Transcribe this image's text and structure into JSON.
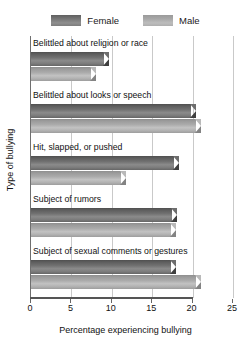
{
  "chart_data": {
    "type": "bar",
    "orientation": "horizontal",
    "title": "",
    "xlabel": "Percentage experiencing bullying",
    "ylabel": "Type of bullying",
    "xlim": [
      0,
      25
    ],
    "xticks": [
      0,
      5,
      10,
      15,
      20,
      25
    ],
    "xtick_labels": [
      "0",
      "5",
      "10",
      "15",
      "20",
      "25"
    ],
    "grid": "vertical",
    "legend_position": "top-center",
    "categories": [
      "Belittled about religion or race",
      "Belittled about looks or speech",
      "Hit, slapped, or pushed",
      "Subject of rumors",
      "Subject of sexual comments or gestures"
    ],
    "series": [
      {
        "name": "Female",
        "color": "#717171",
        "values": [
          9.0,
          19.8,
          17.7,
          17.4,
          17.3
        ]
      },
      {
        "name": "Male",
        "color": "#ababab",
        "values": [
          7.4,
          20.4,
          11.1,
          17.3,
          20.4
        ]
      }
    ]
  },
  "legend": {
    "entries": [
      {
        "label": "Female",
        "swatch": "female-swatch"
      },
      {
        "label": "Male",
        "swatch": "male-swatch"
      }
    ]
  },
  "axes": {
    "x_title": "Percentage experiencing bullying",
    "y_title": "Type of bullying",
    "x_tick_labels": [
      "0",
      "5",
      "10",
      "15",
      "20",
      "25"
    ]
  }
}
